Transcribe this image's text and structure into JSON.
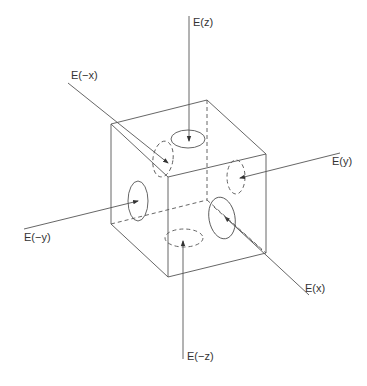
{
  "diagram": {
    "title": "",
    "colors": {
      "line": "#555555",
      "text": "#333333",
      "background": "#ffffff"
    },
    "labels": {
      "ez": "E(z)",
      "emx": "E(−x)",
      "ey": "E(y)",
      "emy": "E(−y)",
      "ex": "E(x)",
      "emz": "E(−z)"
    }
  }
}
